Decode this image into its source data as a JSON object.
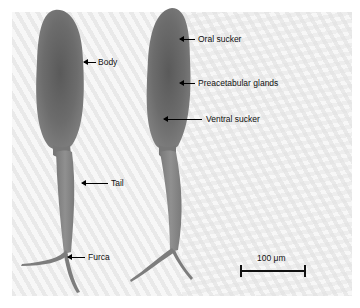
{
  "figure": {
    "specimens": [
      {
        "name": "cercaria-left",
        "labels": [
          {
            "id": "body",
            "text": "Body"
          },
          {
            "id": "tail",
            "text": "Tail"
          },
          {
            "id": "furca",
            "text": "Furca"
          }
        ]
      },
      {
        "name": "cercaria-right",
        "labels": [
          {
            "id": "oral-sucker",
            "text": "Oral sucker"
          },
          {
            "id": "preacetabular-glands",
            "text": "Preacetabular glands"
          },
          {
            "id": "ventral-sucker",
            "text": "Ventral sucker"
          }
        ]
      }
    ],
    "scale_bar": {
      "label": "100 μm"
    },
    "colors": {
      "background_light": "#f7f7f7",
      "background_stripe": "#e9e9e9",
      "organism_body": "#6e6e6e",
      "organism_tail": "#8a8a8a",
      "annotation": "#000000"
    }
  }
}
